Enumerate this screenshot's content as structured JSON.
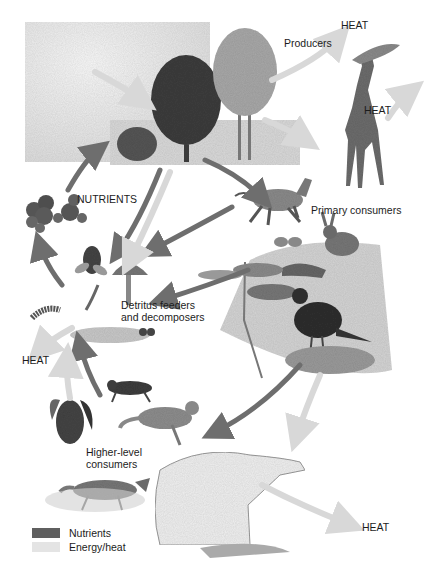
{
  "diagram": {
    "type": "ecosystem nutrient cycling and energy flow illustration",
    "labels": {
      "producers": "Producers",
      "primary_consumers": "Primary consumers",
      "nutrients": "NUTRIENTS",
      "detritus_line1": "Detritus feeders",
      "detritus_line2": "and decomposers",
      "higher_line1": "Higher-level",
      "higher_line2": "consumers",
      "heat_top": "HEAT",
      "heat_giraffe": "HEAT",
      "heat_left": "HEAT",
      "heat_bottom": "HEAT"
    },
    "legend": {
      "items": [
        {
          "label": "Nutrients",
          "color": "#5f5f5f"
        },
        {
          "label": "Energy/heat",
          "color": "#e4e4e4"
        }
      ]
    },
    "colors": {
      "nutrient_arrow": "#6e6e6e",
      "energy_arrow": "#dadada",
      "background": "#ffffff"
    },
    "organisms": {
      "producers": [
        "trees",
        "shrub"
      ],
      "primary_consumers": [
        "giraffe",
        "zebra",
        "rabbit",
        "butterfly",
        "grasshopper",
        "bird"
      ],
      "detritus_feeders": [
        "fly",
        "mushroom",
        "worm",
        "millipede",
        "beetles"
      ],
      "higher_level_consumers": [
        "owl",
        "hyena",
        "cheetah",
        "fox",
        "polar bear"
      ]
    }
  }
}
